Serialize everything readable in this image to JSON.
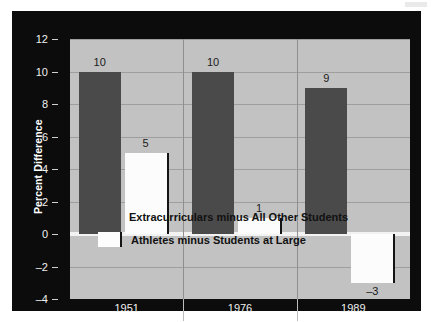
{
  "chart_data": {
    "type": "bar",
    "title": "",
    "xlabel": "",
    "ylabel": "Percent Difference",
    "categories": [
      "1951",
      "1976",
      "1989"
    ],
    "ylim": [
      -4,
      12
    ],
    "yticks": [
      -4,
      -2,
      0,
      2,
      4,
      6,
      8,
      10,
      12
    ],
    "ytick_labels": [
      "–4",
      "–2",
      "0",
      "2",
      "4",
      "6",
      "8",
      "10",
      "12"
    ],
    "grid": true,
    "legend_position": "inside-lower-left",
    "series": [
      {
        "name": "Extracurriculars minus All Other Students",
        "color": "#4a4a4a",
        "values": [
          10,
          10,
          9
        ],
        "value_labels": [
          "10",
          "10",
          "9"
        ]
      },
      {
        "name": "Athletes minus Students at Large",
        "color": "#fcfcfc",
        "values": [
          5,
          1,
          -3
        ],
        "value_labels": [
          "5",
          "1",
          "–3"
        ]
      }
    ]
  },
  "colors": {
    "frame": "#0c0c0c",
    "plot_background": "#c2c2c2",
    "gridline": "#9e9e9e",
    "zero_line": "#f2f2f2",
    "series_dark": "#4a4a4a",
    "series_light": "#fcfcfc",
    "axis_text": "#f0f0f0",
    "label_text": "#1a1a1a"
  }
}
